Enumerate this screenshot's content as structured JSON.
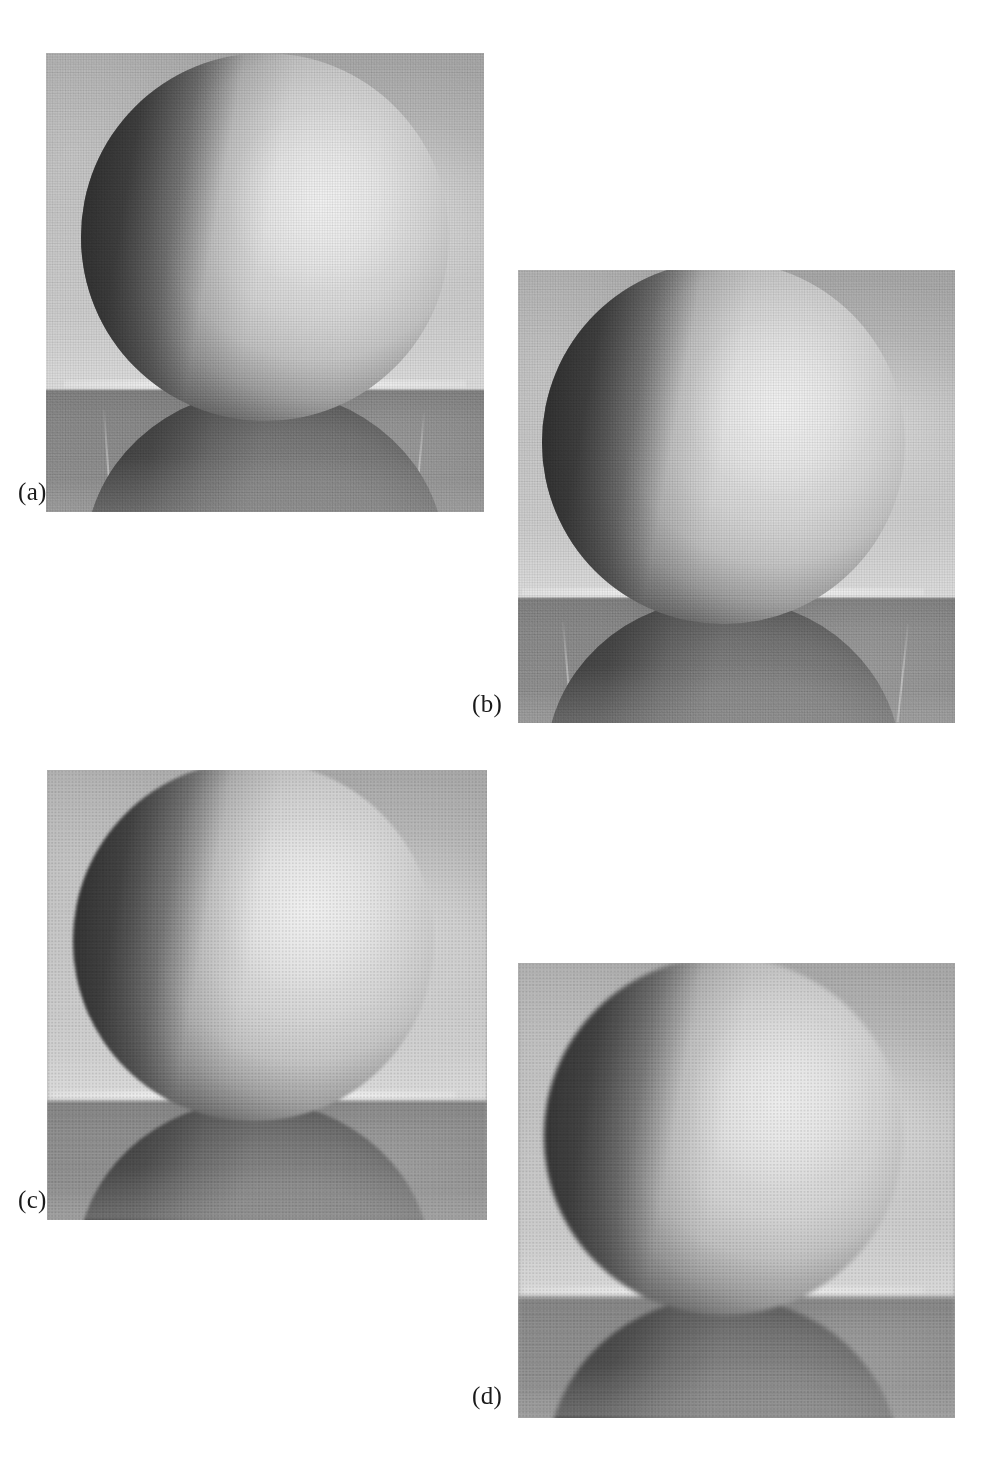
{
  "figure": {
    "background_color": "#ffffff",
    "panel_count": 4,
    "caption_color": "#1a1a1a",
    "panels": [
      {
        "id": "a",
        "caption": "(a)",
        "caption_x": 18,
        "caption_y": 478,
        "x": 46,
        "y": 53,
        "width": 438,
        "height": 459,
        "smoothing": "none",
        "grain": "fine",
        "description": "original noisy image of sphere on reflective surface",
        "horizon_pct": 73,
        "sphere": {
          "cx_pct": 50,
          "cy_pct": 40,
          "d_pct": 84
        },
        "seams": [
          {
            "x_pct": 13,
            "h_pct": 82,
            "tilt": -4
          },
          {
            "x_pct": 48,
            "h_pct": 96,
            "tilt": 0
          },
          {
            "x_pct": 86,
            "h_pct": 80,
            "tilt": 5
          }
        ]
      },
      {
        "id": "b",
        "caption": "(b)",
        "caption_x": 472,
        "caption_y": 690,
        "x": 518,
        "y": 270,
        "width": 437,
        "height": 453,
        "smoothing": "light",
        "grain": "fine",
        "description": "image after 3x3 averaging / light smoothing",
        "horizon_pct": 72,
        "sphere": {
          "cx_pct": 47,
          "cy_pct": 38,
          "d_pct": 83
        },
        "seams": [
          {
            "x_pct": 10,
            "h_pct": 80,
            "tilt": -5
          },
          {
            "x_pct": 49,
            "h_pct": 96,
            "tilt": 0
          },
          {
            "x_pct": 89,
            "h_pct": 78,
            "tilt": 6
          }
        ]
      },
      {
        "id": "c",
        "caption": "(c)",
        "caption_x": 18,
        "caption_y": 1186,
        "x": 47,
        "y": 770,
        "width": 440,
        "height": 450,
        "smoothing": "medium",
        "grain": "soft",
        "description": "image after larger-kernel smoothing; seam lines blurred away",
        "horizon_pct": 73,
        "sphere": {
          "cx_pct": 47,
          "cy_pct": 38,
          "d_pct": 82
        },
        "seams": []
      },
      {
        "id": "d",
        "caption": "(d)",
        "caption_x": 472,
        "caption_y": 1382,
        "x": 518,
        "y": 963,
        "width": 437,
        "height": 455,
        "smoothing": "heavy",
        "grain": "soft",
        "description": "image after heaviest smoothing; only coarse structure remains",
        "horizon_pct": 73,
        "sphere": {
          "cx_pct": 47,
          "cy_pct": 38,
          "d_pct": 82
        },
        "seams": []
      }
    ]
  }
}
